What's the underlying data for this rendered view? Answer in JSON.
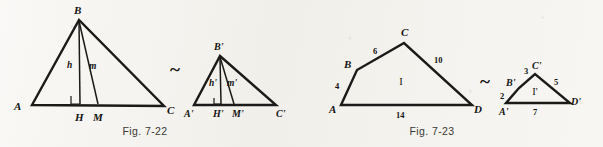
{
  "page": {
    "background_color": "#f3f1ec",
    "ink_color": "#1b1a18",
    "width": 603,
    "height": 147
  },
  "figures": [
    {
      "id": "fig-7-22",
      "caption": "Fig. 7-22",
      "relation_symbol": "~",
      "description": "Two similar triangles with altitude h and median m",
      "shapes": [
        {
          "id": "triangle-abc",
          "vertices": [
            "A",
            "B",
            "C"
          ],
          "interior_points": [
            "H",
            "M"
          ],
          "segment_labels": [
            "h",
            "m"
          ],
          "right_angle_at": "H"
        },
        {
          "id": "triangle-abc-prime",
          "vertices": [
            "A'",
            "B'",
            "C'"
          ],
          "interior_points": [
            "H'",
            "M'"
          ],
          "segment_labels": [
            "h'",
            "m'"
          ],
          "right_angle_at": "H'"
        }
      ],
      "labels": {
        "A": "A",
        "B": "B",
        "C": "C",
        "H": "H",
        "M": "M",
        "h": "h",
        "m": "m",
        "A_prime": "A'",
        "B_prime": "B'",
        "C_prime": "C'",
        "H_prime": "H'",
        "M_prime": "M'",
        "h_prime": "h'",
        "m_prime": "m'"
      }
    },
    {
      "id": "fig-7-23",
      "caption": "Fig. 7-23",
      "relation_symbol": "~",
      "description": "Two similar quadrilaterals I and I' with side lengths",
      "shapes": [
        {
          "id": "quad-abcd",
          "region_label": "I",
          "vertices": [
            "A",
            "B",
            "C",
            "D"
          ],
          "sides": [
            {
              "from": "A",
              "to": "B",
              "length": "4"
            },
            {
              "from": "B",
              "to": "C",
              "length": "6"
            },
            {
              "from": "C",
              "to": "D",
              "length": "10"
            },
            {
              "from": "A",
              "to": "D",
              "length": "14"
            }
          ]
        },
        {
          "id": "quad-abcd-prime",
          "region_label": "I'",
          "vertices": [
            "A'",
            "B'",
            "C'",
            "D'"
          ],
          "sides": [
            {
              "from": "A'",
              "to": "B'",
              "length": "2"
            },
            {
              "from": "B'",
              "to": "C'",
              "length": "3"
            },
            {
              "from": "C'",
              "to": "D'",
              "length": "5"
            },
            {
              "from": "A'",
              "to": "D'",
              "length": "7"
            }
          ]
        }
      ],
      "labels": {
        "A": "A",
        "B": "B",
        "C": "C",
        "D": "D",
        "I": "I",
        "A_prime": "A'",
        "B_prime": "B'",
        "C_prime": "C'",
        "D_prime": "D'",
        "I_prime": "I'",
        "side_ab": "4",
        "side_bc": "6",
        "side_cd": "10",
        "side_ad": "14",
        "side_ab_prime": "2",
        "side_bc_prime": "3",
        "side_cd_prime": "5",
        "side_ad_prime": "7"
      }
    }
  ]
}
